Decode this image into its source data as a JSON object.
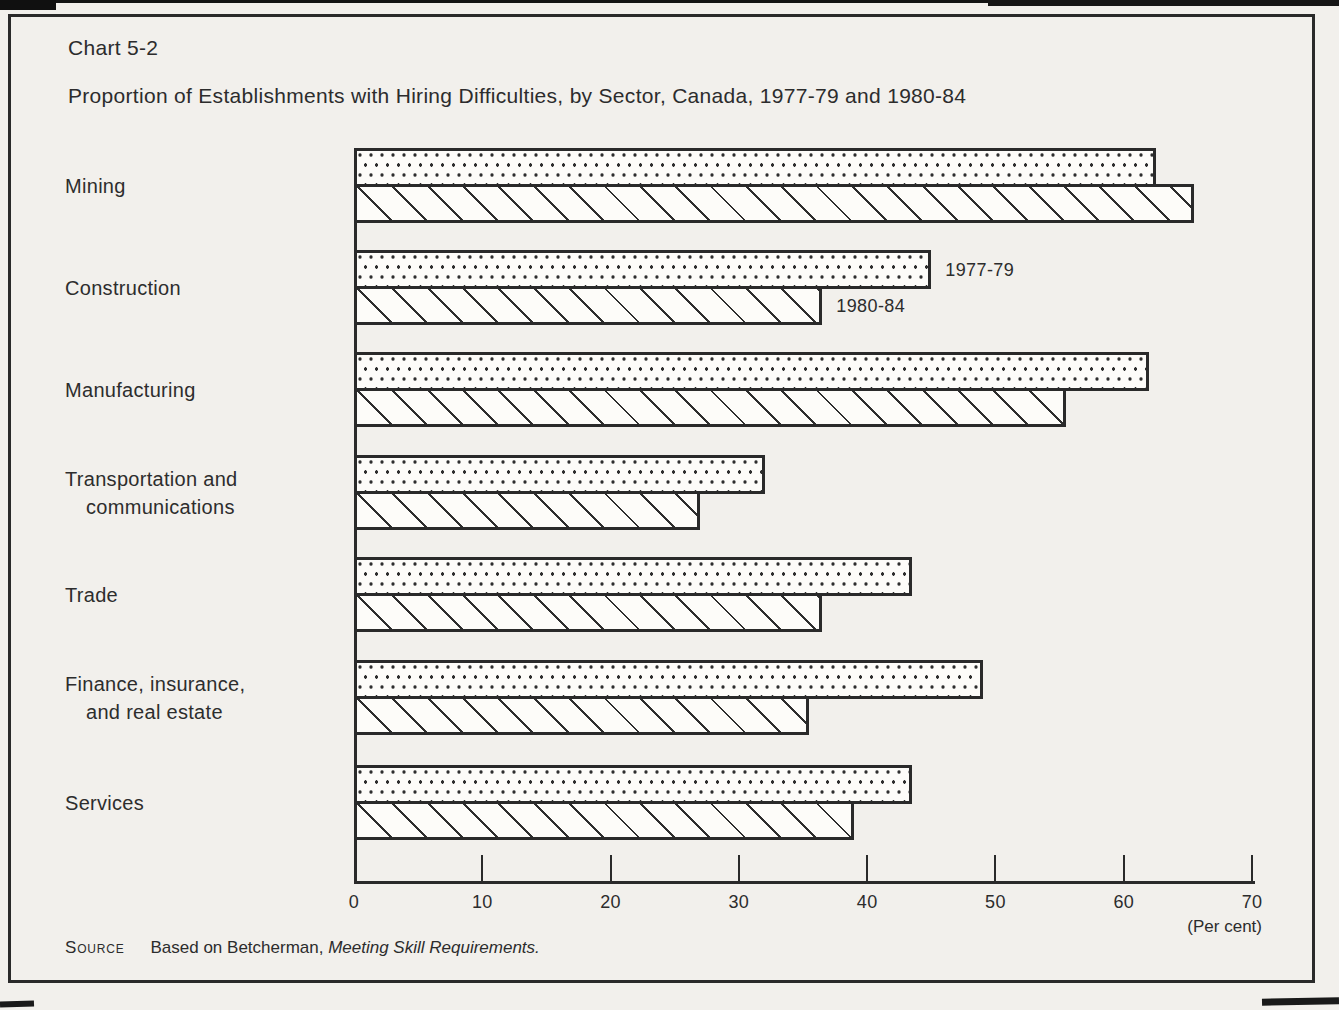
{
  "page": {
    "title": "Chart 5-2",
    "subtitle": "Proportion of Establishments with Hiring Difficulties, by Sector, Canada, 1977-79 and 1980-84",
    "source": {
      "label": "Source",
      "prefix": "Based on Betcherman,",
      "work": "Meeting Skill Requirements."
    }
  },
  "chart_data": {
    "type": "bar",
    "orientation": "horizontal",
    "title": "Chart 5-2",
    "subtitle": "Proportion of Establishments with Hiring Difficulties, by Sector, Canada, 1977-79 and 1980-84",
    "categories": [
      "Mining",
      "Construction",
      "Manufacturing",
      "Transportation and communications",
      "Trade",
      "Finance, insurance, and real estate",
      "Services"
    ],
    "category_label_lines": [
      [
        "Mining"
      ],
      [
        "Construction"
      ],
      [
        "Manufacturing"
      ],
      [
        "Transportation and",
        "communications"
      ],
      [
        "Trade"
      ],
      [
        "Finance, insurance,",
        "and real estate"
      ],
      [
        "Services"
      ]
    ],
    "series": [
      {
        "name": "1977-79",
        "pattern": "dots",
        "values": [
          62.5,
          45.0,
          62.0,
          32.0,
          43.5,
          49.0,
          43.5
        ]
      },
      {
        "name": "1980-84",
        "pattern": "diagonal-hatch",
        "values": [
          65.5,
          36.5,
          55.5,
          27.0,
          36.5,
          35.5,
          39.0
        ]
      }
    ],
    "xlim": [
      0,
      70
    ],
    "xticks": [
      0,
      10,
      20,
      30,
      40,
      50,
      60,
      70
    ],
    "xlabel": "(Per cent)",
    "grid": false,
    "legend_position": "beside-construction-bars",
    "ink_color": "#2a2a2a",
    "paper_color": "#f2f0ec"
  }
}
